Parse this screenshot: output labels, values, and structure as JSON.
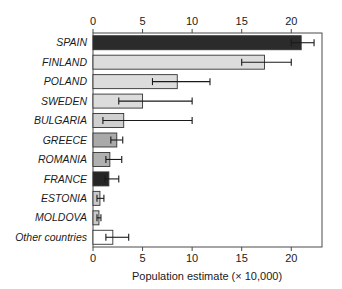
{
  "chart_data": {
    "type": "bar",
    "orientation": "horizontal",
    "title": "",
    "xlabel": "Population estimate (× 10,000)",
    "ylabel": "",
    "xlim": [
      0,
      23.1
    ],
    "xticks": [
      0,
      5,
      10,
      15,
      20
    ],
    "xticklabels": [
      "0",
      "5",
      "10",
      "15",
      "20"
    ],
    "grid": false,
    "legend": "none",
    "categories": [
      "SPAIN",
      "FINLAND",
      "POLAND",
      "SWEDEN",
      "BULGARIA",
      "GREECE",
      "ROMANIA",
      "FRANCE",
      "ESTONIA",
      "MOLDOVA",
      "Other countries"
    ],
    "values": [
      21.0,
      17.3,
      8.5,
      5.0,
      3.1,
      2.4,
      1.7,
      1.6,
      0.7,
      0.6,
      2.0
    ],
    "err_low": [
      20.0,
      15.0,
      6.0,
      2.6,
      1.0,
      1.8,
      1.3,
      1.2,
      0.4,
      0.4,
      1.3
    ],
    "err_high": [
      22.3,
      20.0,
      11.8,
      10.0,
      10.0,
      3.0,
      2.9,
      2.6,
      1.1,
      0.8,
      3.6
    ],
    "bar_colors": [
      "#2b2b2b",
      "#dcdcdc",
      "#dcdcdc",
      "#dcdcdc",
      "#d0d0d0",
      "#a9a9a9",
      "#b0b0b0",
      "#262626",
      "#c9c9c9",
      "#c9c9c9",
      "#ffffff"
    ],
    "bar_edge_color": "#333333",
    "error_color": "#1a1a1a",
    "axis_color": "#4a4a4a"
  }
}
